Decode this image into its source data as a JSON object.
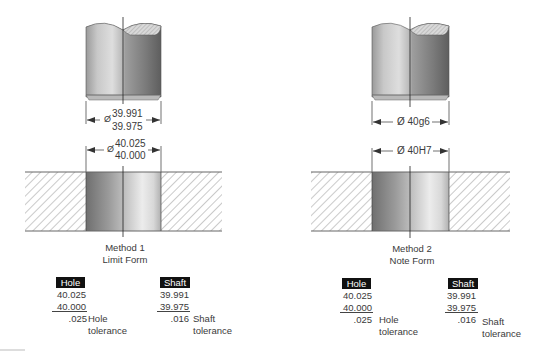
{
  "figure": {
    "method1": {
      "title": "Method 1",
      "subtitle": "Limit Form",
      "shaft_dimension": {
        "symbol": "Ø",
        "upper": "39.991",
        "lower": "39.975"
      },
      "hole_dimension": {
        "symbol": "Ø",
        "upper": "40.025",
        "lower": "40.000"
      },
      "hole_calc": {
        "label": "Hole",
        "max": "40.025",
        "min": "40.000",
        "tolerance": ".025",
        "tolerance_label_1": "Hole",
        "tolerance_label_2": "tolerance"
      },
      "shaft_calc": {
        "label": "Shaft",
        "max": "39.991",
        "min": "39.975",
        "tolerance": ".016",
        "tolerance_label_1": "Shaft",
        "tolerance_label_2": "tolerance"
      }
    },
    "method2": {
      "title": "Method 2",
      "subtitle": "Note Form",
      "shaft_dimension": {
        "text": "Ø 40g6"
      },
      "hole_dimension": {
        "text": "Ø 40H7"
      },
      "hole_calc": {
        "label": "Hole",
        "max": "40.025",
        "min": "40.000",
        "tolerance": ".025",
        "tolerance_label_1": "Hole",
        "tolerance_label_2": "tolerance"
      },
      "shaft_calc": {
        "label": "Shaft",
        "max": "39.991",
        "min": "39.975",
        "tolerance": ".016",
        "tolerance_label_1": "Shaft",
        "tolerance_label_2": "tolerance"
      }
    },
    "colors": {
      "line": "#333333",
      "badge_bg": "#111111",
      "badge_text": "#ffffff",
      "hatch": "#8a8a8a"
    }
  }
}
